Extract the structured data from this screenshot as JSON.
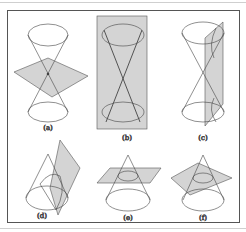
{
  "figure": {
    "panels": [
      {
        "id": "a",
        "label": "(a)"
      },
      {
        "id": "b",
        "label": "(b)"
      },
      {
        "id": "c",
        "label": "(c)"
      },
      {
        "id": "d",
        "label": "(d)"
      },
      {
        "id": "e",
        "label": "(e)"
      },
      {
        "id": "f",
        "label": "(f)"
      }
    ],
    "colors": {
      "plane": "#d4d4d4",
      "stroke": "#444444",
      "frame": "#555555"
    }
  }
}
